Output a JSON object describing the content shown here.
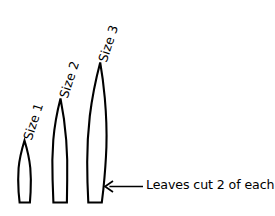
{
  "figure": {
    "background_color": "#ffffff",
    "ink_color": "#000000",
    "width": 275,
    "height": 216
  },
  "labels": [
    {
      "text": "Size 1",
      "left": 22,
      "top": 138
    },
    {
      "text": "Size 2",
      "left": 58,
      "top": 96
    },
    {
      "text": "Size 3",
      "left": 97,
      "top": 60
    }
  ],
  "leaves": [
    {
      "name": "size-1",
      "label": "Size 1",
      "tip_x": 24.5,
      "tip_y": 140,
      "base_y": 203,
      "max_width": 13,
      "base_width": 7,
      "path": "M 24.5 140.5 C 21.6 150 19.4 159 18.6 168 C 18.0 176 18.1 184 18.6 192 L 19.6 202.5 L 29.9 202.5 L 30.6 192 C 31.0 184 31.0 176 30.3 168 C 29.4 159 27.4 150 24.5 140.5 Z"
    },
    {
      "name": "size-2",
      "label": "Size 2",
      "tip_x": 60.5,
      "tip_y": 98,
      "base_y": 203,
      "max_width": 15,
      "base_width": 9,
      "path": "M 60.5 98.5 C 57.0 112 54.5 126 53.3 140 C 52.3 153 52.1 167 52.6 180 L 53.4 202.5 L 66.9 202.5 L 67.2 180 C 67.5 167 67.2 153 66.2 140 C 65.1 126 63.2 112 60.5 98.5 Z"
    },
    {
      "name": "size-3",
      "label": "Size 3",
      "tip_x": 100,
      "tip_y": 62,
      "base_y": 203,
      "max_width": 20,
      "base_width": 11,
      "path": "M 100.2 62.5 C 95.6 80 92.0 98 89.8 116 C 88.1 131 87.2 147 87.2 162 C 87.2 175 87.6 189 88.3 202.5 L 101.8 202.5 L 103.4 189 C 104.8 175 105.9 161 106.4 147 C 106.9 131 106.2 114 104.8 98 C 103.7 86 102.2 74 100.2 62.5 Z"
    }
  ],
  "annotation": {
    "arrow": {
      "name": "leader-arrow",
      "direction": "left",
      "tip_x": 105,
      "tip_y": 186.5,
      "tail_x": 143,
      "tail_y": 186.5,
      "head_len": 8,
      "head_spread": 5.5
    },
    "caption": "Leaves cut 2 of each"
  }
}
